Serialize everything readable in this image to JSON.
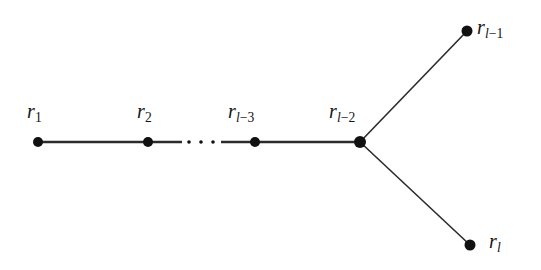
{
  "figure": {
    "kind": "graph-diagram",
    "background_color": "#ffffff",
    "node_color": "#111111",
    "edge_color": "#2b2b2b"
  },
  "nodes": [
    {
      "id": "r1",
      "label_prefix": "r",
      "label_sub": "1",
      "label_plain": "r_1",
      "x": 38,
      "y": 142,
      "radius": 5.0,
      "label_x": 27,
      "label_y": 101,
      "label_position": "above"
    },
    {
      "id": "r2",
      "label_prefix": "r",
      "label_sub": "2",
      "label_plain": "r_2",
      "x": 148,
      "y": 142,
      "radius": 5.0,
      "label_x": 137,
      "label_y": 101,
      "label_position": "above"
    },
    {
      "id": "rl-3",
      "label_prefix": "r",
      "label_sub": "l-3",
      "label_plain": "r_{l-3}",
      "x": 255,
      "y": 142,
      "radius": 5.0,
      "label_x": 228,
      "label_y": 101,
      "label_position": "above"
    },
    {
      "id": "rl-2",
      "label_prefix": "r",
      "label_sub": "l-2",
      "label_plain": "r_{l-2}",
      "x": 360,
      "y": 142,
      "radius": 6.0,
      "label_x": 329,
      "label_y": 101,
      "label_position": "above"
    },
    {
      "id": "rl-1",
      "label_prefix": "r",
      "label_sub": "l-1",
      "label_plain": "r_{l-1}",
      "x": 467,
      "y": 31,
      "radius": 5.5,
      "label_x": 477,
      "label_y": 17,
      "label_position": "right"
    },
    {
      "id": "rl",
      "label_prefix": "r",
      "label_sub": "l",
      "label_plain": "r_l",
      "x": 470,
      "y": 245,
      "radius": 5.5,
      "label_x": 489,
      "label_y": 231,
      "label_position": "right"
    }
  ],
  "edges": [
    {
      "id": "e-r1-r2",
      "from": "r1",
      "to": "r2",
      "x1": 38,
      "y1": 142,
      "x2": 148,
      "y2": 142,
      "width": 2.4
    },
    {
      "id": "e-r2-gap",
      "from": "r2",
      "to": "dots",
      "x1": 148,
      "y1": 142,
      "x2": 182,
      "y2": 142,
      "width": 2.4
    },
    {
      "id": "e-gap-rl3",
      "from": "dots",
      "to": "rl-3",
      "x1": 221,
      "y1": 142,
      "x2": 255,
      "y2": 142,
      "width": 2.4
    },
    {
      "id": "e-rl3-rl2",
      "from": "rl-3",
      "to": "rl-2",
      "x1": 255,
      "y1": 142,
      "x2": 360,
      "y2": 142,
      "width": 2.4
    },
    {
      "id": "e-rl2-rl1",
      "from": "rl-2",
      "to": "rl-1",
      "x1": 360,
      "y1": 142,
      "x2": 467,
      "y2": 31,
      "width": 1.6
    },
    {
      "id": "e-rl2-rl",
      "from": "rl-2",
      "to": "rl",
      "x1": 360,
      "y1": 142,
      "x2": 470,
      "y2": 245,
      "width": 1.6
    }
  ],
  "ellipsis": {
    "label_plain": "...",
    "y": 142,
    "radius": 1.8,
    "dots_x": [
      189,
      201,
      213
    ]
  }
}
